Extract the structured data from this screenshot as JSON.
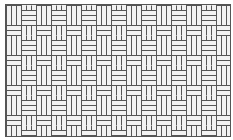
{
  "image": {
    "subject": "basketweave-tile-pattern",
    "colors": {
      "tile": "#f2f2f2",
      "grout": "#555555",
      "background": "#ffffff"
    }
  }
}
